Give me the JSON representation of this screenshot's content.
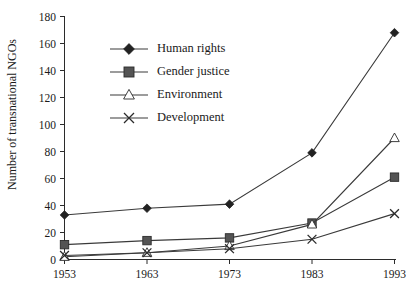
{
  "chart_data": {
    "type": "line",
    "title": "",
    "xlabel": "",
    "ylabel": "Number of transnational  NGOs",
    "x": [
      1953,
      1963,
      1973,
      1983,
      1993
    ],
    "xticklabels": [
      "1953",
      "1963",
      "1973",
      "1983",
      "1993"
    ],
    "yticks": [
      0,
      20,
      40,
      60,
      80,
      100,
      120,
      140,
      160,
      180
    ],
    "yticklabels": [
      "0",
      "20",
      "40",
      "60",
      "80",
      "100",
      "120",
      "140",
      "160",
      "180"
    ],
    "ylim": [
      0,
      180
    ],
    "grid": false,
    "legend_position": "upper-left-inside",
    "series": [
      {
        "name": "Human rights",
        "marker": "diamond-filled",
        "values": [
          33,
          38,
          41,
          79,
          168
        ]
      },
      {
        "name": "Gender justice",
        "marker": "square-filled",
        "values": [
          11,
          14,
          16,
          27,
          61
        ]
      },
      {
        "name": "Environment",
        "marker": "triangle-hollow",
        "values": [
          2,
          5,
          10,
          26,
          90
        ]
      },
      {
        "name": "Development",
        "marker": "cross",
        "values": [
          3,
          5,
          8,
          15,
          34
        ]
      }
    ]
  },
  "legend": {
    "entries": [
      {
        "label": "Human rights"
      },
      {
        "label": "Gender justice"
      },
      {
        "label": "Environment"
      },
      {
        "label": "Development"
      }
    ]
  },
  "colors": {
    "line": "#3a3a3a",
    "axis": "#2b2b2b",
    "text": "#1a1a1a",
    "background": "#ffffff",
    "square_fill": "#545454",
    "hollow_fill": "#ffffff"
  }
}
